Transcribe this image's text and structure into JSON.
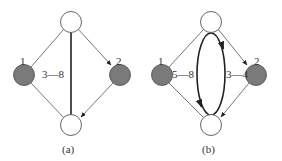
{
  "figure": {
    "panels": [
      {
        "caption": "(a)",
        "nodes": [
          {
            "id": "top",
            "label": "",
            "fill": "#ffffff"
          },
          {
            "id": "left",
            "label": "1",
            "fill": "#7a7a7a"
          },
          {
            "id": "right",
            "label": "2",
            "fill": "#7a7a7a"
          },
          {
            "id": "bottom",
            "label": "",
            "fill": "#ffffff"
          }
        ],
        "edges": [
          {
            "from": "top",
            "to": "left",
            "directed": false
          },
          {
            "from": "left",
            "to": "bottom",
            "directed": false
          },
          {
            "from": "top",
            "to": "right",
            "directed": true
          },
          {
            "from": "right",
            "to": "bottom",
            "directed": true
          },
          {
            "from": "top",
            "to": "bottom",
            "directed": false,
            "bold": true
          }
        ],
        "annotations": [
          "3—8"
        ]
      },
      {
        "caption": "(b)",
        "nodes": [
          {
            "id": "top",
            "label": "",
            "fill": "#ffffff"
          },
          {
            "id": "left",
            "label": "1",
            "fill": "#7a7a7a"
          },
          {
            "id": "right",
            "label": "2",
            "fill": "#7a7a7a"
          },
          {
            "id": "bottom",
            "label": "",
            "fill": "#ffffff"
          }
        ],
        "edges": [
          {
            "from": "top",
            "to": "left",
            "directed": false
          },
          {
            "from": "left",
            "to": "bottom",
            "directed": false
          },
          {
            "from": "top",
            "to": "right",
            "directed": true
          },
          {
            "from": "right",
            "to": "bottom",
            "directed": true
          },
          {
            "from": "top",
            "to": "bottom",
            "directed": true,
            "bold": true,
            "shape": "ellipse-cycle"
          }
        ],
        "annotations": [
          "5—8",
          "3—4"
        ]
      }
    ]
  },
  "colors": {
    "edge": "#555555",
    "bold_edge": "#222222",
    "shaded_node": "#7a7a7a",
    "node_stroke": "#555555"
  }
}
